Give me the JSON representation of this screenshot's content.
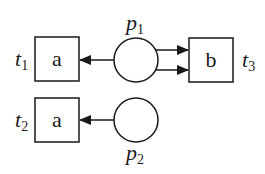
{
  "diagram": {
    "type": "petri-net",
    "colors": {
      "stroke": "#1a1a1a",
      "fill": "#ffffff"
    },
    "transitions": [
      {
        "id": "t1",
        "name": "t",
        "sub": "1",
        "label": "a"
      },
      {
        "id": "t2",
        "name": "t",
        "sub": "2",
        "label": "a"
      },
      {
        "id": "t3",
        "name": "t",
        "sub": "3",
        "label": "b"
      }
    ],
    "places": [
      {
        "id": "p1",
        "name": "p",
        "sub": "1"
      },
      {
        "id": "p2",
        "name": "p",
        "sub": "2"
      }
    ],
    "arcs": [
      {
        "from": "p1",
        "to": "t1"
      },
      {
        "from": "p1",
        "to": "t3"
      },
      {
        "from": "p1",
        "to": "t3"
      },
      {
        "from": "p2",
        "to": "t2"
      }
    ]
  }
}
